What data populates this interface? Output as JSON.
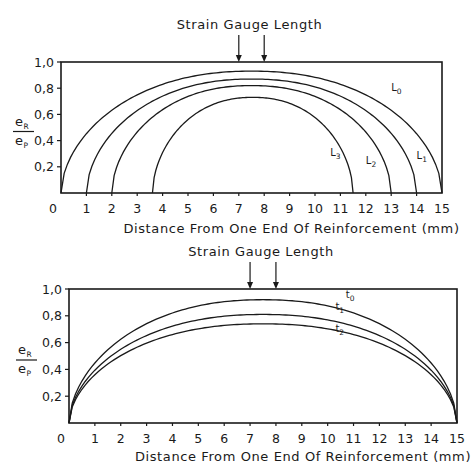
{
  "chart_data": [
    {
      "type": "line",
      "title": "Strain Gauge Length",
      "annotation": "Strain Gauge Length",
      "gauge_markers_x": [
        7,
        8
      ],
      "xlabel": "Distance From One End Of Reinforcement (mm)",
      "ylabel_num": "e",
      "ylabel_num_sub": "R",
      "ylabel_den": "e",
      "ylabel_den_sub": "P",
      "xlim": [
        0,
        15
      ],
      "ylim": [
        0,
        1.0
      ],
      "xticks": [
        "0",
        "1",
        "2",
        "3",
        "4",
        "5",
        "6",
        "7",
        "8",
        "9",
        "10",
        "11",
        "12",
        "13",
        "14",
        "15"
      ],
      "yticks": [
        "0,2",
        "0,4",
        "0,6",
        "0,8",
        "1,0"
      ],
      "grid": false,
      "series": [
        {
          "name": "L0",
          "label_main": "L",
          "label_sub": "0",
          "start": 0,
          "end": 15,
          "peak_x": 7.5,
          "peak": 0.93,
          "label_pos": [
            13.0,
            0.78
          ]
        },
        {
          "name": "L1",
          "label_main": "L",
          "label_sub": "1",
          "start": 1,
          "end": 14,
          "peak_x": 7.5,
          "peak": 0.87,
          "label_pos": [
            14.0,
            0.26
          ]
        },
        {
          "name": "L2",
          "label_main": "L",
          "label_sub": "2",
          "start": 2,
          "end": 13,
          "peak_x": 7.5,
          "peak": 0.82,
          "label_pos": [
            12.0,
            0.22
          ]
        },
        {
          "name": "L3",
          "label_main": "L",
          "label_sub": "3",
          "start": 3.6,
          "end": 11.5,
          "peak_x": 7.5,
          "peak": 0.73,
          "label_pos": [
            10.6,
            0.28
          ]
        }
      ]
    },
    {
      "type": "line",
      "title": "Strain Gauge Length",
      "annotation": "Strain Gauge Length",
      "gauge_markers_x": [
        7,
        8
      ],
      "xlabel": "Distance From One End Of Reinforcement (mm)",
      "ylabel_num": "e",
      "ylabel_num_sub": "R",
      "ylabel_den": "e",
      "ylabel_den_sub": "P",
      "xlim": [
        0,
        15
      ],
      "ylim": [
        0,
        1.0
      ],
      "xticks": [
        "0",
        "1",
        "2",
        "3",
        "4",
        "5",
        "6",
        "7",
        "8",
        "9",
        "10",
        "11",
        "12",
        "13",
        "14",
        "15"
      ],
      "yticks": [
        "0,2",
        "0,4",
        "0,6",
        "0,8",
        "1,0"
      ],
      "grid": false,
      "series": [
        {
          "name": "t0",
          "label_main": "t",
          "label_sub": "0",
          "start": 0,
          "end": 15,
          "peak_x": 7.5,
          "peak": 0.92,
          "label_pos": [
            10.7,
            0.93
          ]
        },
        {
          "name": "t1",
          "label_main": "t",
          "label_sub": "1",
          "start": 0,
          "end": 15,
          "peak_x": 7.5,
          "peak": 0.81,
          "label_pos": [
            10.3,
            0.84
          ]
        },
        {
          "name": "t2",
          "label_main": "t",
          "label_sub": "2",
          "start": 0,
          "end": 15,
          "peak_x": 7.5,
          "peak": 0.74,
          "label_pos": [
            10.3,
            0.68
          ]
        }
      ]
    }
  ]
}
